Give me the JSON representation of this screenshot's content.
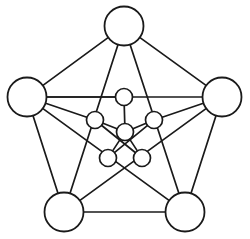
{
  "figure": {
    "background_color": "#ffffff",
    "stroke_color": "#1a1a1a",
    "node_fill_color": "#ffffff",
    "width": 250,
    "height": 239
  },
  "chart_data": {
    "type": "diagram",
    "title": "",
    "node_count": 11,
    "edge_count": 20,
    "nodes": [
      {
        "id": "top",
        "label": "",
        "group": "outer",
        "x": 124,
        "y": 26,
        "r": 19.5
      },
      {
        "id": "left",
        "label": "",
        "group": "outer",
        "x": 27,
        "y": 97,
        "r": 19.5
      },
      {
        "id": "right",
        "label": "",
        "group": "outer",
        "x": 222,
        "y": 97,
        "r": 19.5
      },
      {
        "id": "bottom_left",
        "label": "",
        "group": "outer",
        "x": 64,
        "y": 212,
        "r": 19.5
      },
      {
        "id": "bottom_right",
        "label": "",
        "group": "outer",
        "x": 185,
        "y": 212,
        "r": 19.5
      },
      {
        "id": "inner_top",
        "label": "",
        "group": "inner",
        "x": 124,
        "y": 97,
        "r": 8.5
      },
      {
        "id": "inner_left",
        "label": "",
        "group": "inner",
        "x": 95,
        "y": 120,
        "r": 8.5
      },
      {
        "id": "inner_right",
        "label": "",
        "group": "inner",
        "x": 154,
        "y": 120,
        "r": 8.5
      },
      {
        "id": "inner_center",
        "label": "",
        "group": "inner",
        "x": 125,
        "y": 132,
        "r": 8.5
      },
      {
        "id": "inner_bottom_left",
        "label": "",
        "group": "inner",
        "x": 108,
        "y": 158,
        "r": 8.5
      },
      {
        "id": "inner_bottom_right",
        "label": "",
        "group": "inner",
        "x": 142,
        "y": 158,
        "r": 8.5
      }
    ],
    "edges": [
      {
        "from": "top",
        "to": "left"
      },
      {
        "from": "top",
        "to": "right"
      },
      {
        "from": "left",
        "to": "bottom_left"
      },
      {
        "from": "right",
        "to": "bottom_right"
      },
      {
        "from": "bottom_left",
        "to": "bottom_right"
      },
      {
        "from": "left",
        "to": "right"
      },
      {
        "from": "top",
        "to": "bottom_left"
      },
      {
        "from": "top",
        "to": "bottom_right"
      },
      {
        "from": "left",
        "to": "bottom_right"
      },
      {
        "from": "right",
        "to": "bottom_left"
      },
      {
        "from": "left",
        "to": "inner_left"
      },
      {
        "from": "right",
        "to": "inner_right"
      },
      {
        "from": "inner_top",
        "to": "inner_center"
      },
      {
        "from": "inner_left",
        "to": "inner_center"
      },
      {
        "from": "inner_right",
        "to": "inner_center"
      },
      {
        "from": "inner_bottom_left",
        "to": "inner_center"
      },
      {
        "from": "inner_bottom_right",
        "to": "inner_center"
      },
      {
        "from": "inner_left",
        "to": "inner_bottom_right"
      },
      {
        "from": "inner_right",
        "to": "inner_bottom_left"
      },
      {
        "from": "inner_top",
        "to": "left"
      }
    ]
  }
}
